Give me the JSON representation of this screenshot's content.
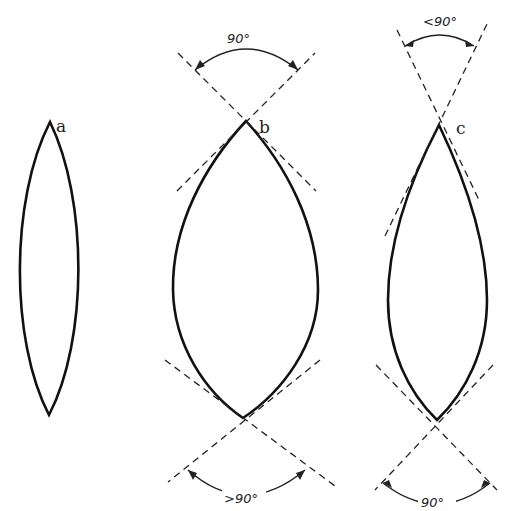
{
  "figure": {
    "shapes": [
      {
        "id": "a",
        "label": "a"
      },
      {
        "id": "b",
        "label": "b"
      },
      {
        "id": "c",
        "label": "c"
      }
    ],
    "angles": {
      "b_top": "90°",
      "b_bottom": ">90°",
      "c_top": "<90°",
      "c_bottom": "90°"
    }
  },
  "colors": {
    "ink": "#111111",
    "background": "#ffffff"
  }
}
